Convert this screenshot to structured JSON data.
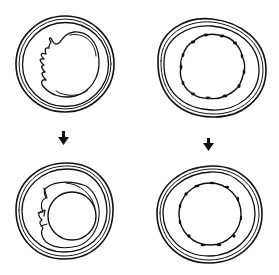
{
  "figure": {
    "colors": {
      "line": "#111111",
      "background": "#ffffff"
    },
    "panels": [
      {
        "id": "top-left",
        "label": "",
        "feature": "outer double ring with irregular folded inner membrane on left"
      },
      {
        "id": "top-right",
        "label": "",
        "feature": "outer double ring with scalloped inner circle with nodules"
      },
      {
        "id": "bottom-left",
        "label": "",
        "feature": "outer double ring with inner circle and stippled crescent layer with spikes"
      },
      {
        "id": "bottom-right",
        "label": "",
        "feature": "outer double ring with inner circle bearing small nodules"
      }
    ],
    "arrows": [
      {
        "id": "left-arrow",
        "direction": "down",
        "glyph": "down-arrow"
      },
      {
        "id": "right-arrow",
        "direction": "down",
        "glyph": "down-arrow"
      }
    ]
  }
}
